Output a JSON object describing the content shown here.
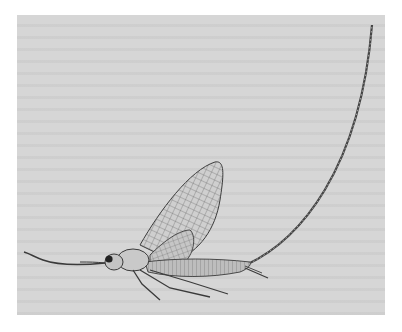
{
  "image": {
    "subject": "Mayfly illustration",
    "alt": "Scientific line drawing of an adult mayfly in side view with long upturned tail filament, on gray paper",
    "colors": {
      "page": "#ffffff",
      "paper": "#d6d6d6",
      "ink": "#3a3a3a",
      "wing_fill": "#cfcfcf",
      "body_fill": "#bdbdbd"
    }
  }
}
